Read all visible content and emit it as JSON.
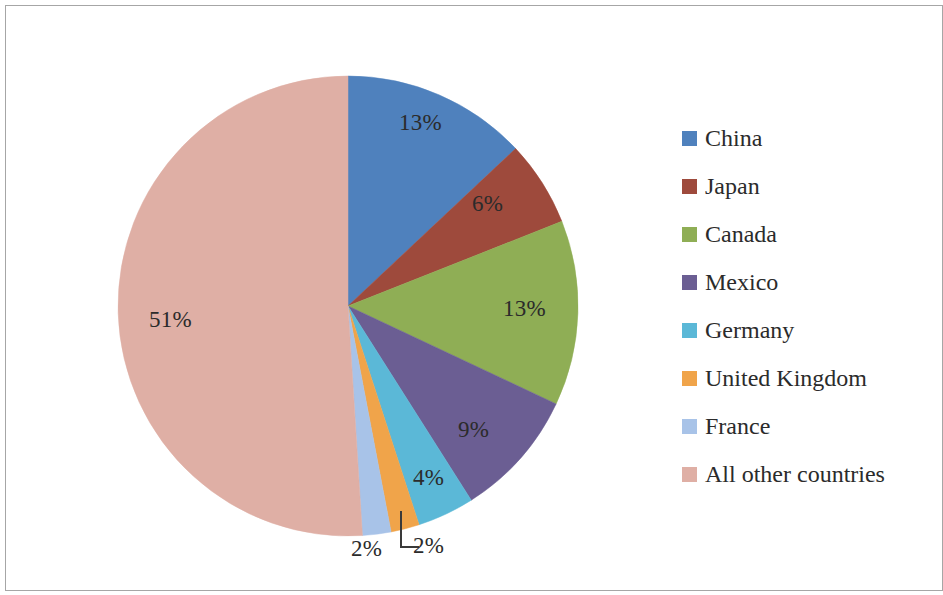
{
  "chart_data": {
    "type": "pie",
    "title": "",
    "subtitle": "",
    "xlabel": "",
    "ylabel": "",
    "legend_position": "right",
    "grid": false,
    "start_angle_clock_position": "12 o'clock",
    "direction": "clockwise",
    "categories": [
      "China",
      "Japan",
      "Canada",
      "Mexico",
      "Germany",
      "United Kingdom",
      "France",
      "All other countries"
    ],
    "values": [
      13,
      6,
      13,
      9,
      4,
      2,
      2,
      51
    ],
    "value_labels": [
      "13%",
      "6%",
      "13%",
      "9%",
      "4%",
      "2%",
      "2%",
      "51%"
    ],
    "colors": [
      "#4F81BD",
      "#9E4A3C",
      "#8FAE55",
      "#6B5E93",
      "#5BB8D7",
      "#F0A44A",
      "#A8C3E8",
      "#DFAFA5"
    ],
    "annotations": [
      "United Kingdom 2% label is placed outside the pie with an L-shaped leader line",
      "France 2% label is placed outside the pie below the slice"
    ]
  },
  "legend": {
    "items": [
      {
        "label": "China",
        "color": "#4F81BD"
      },
      {
        "label": "Japan",
        "color": "#9E4A3C"
      },
      {
        "label": "Canada",
        "color": "#8FAE55"
      },
      {
        "label": "Mexico",
        "color": "#6B5E93"
      },
      {
        "label": "Germany",
        "color": "#5BB8D7"
      },
      {
        "label": "United Kingdom",
        "color": "#F0A44A"
      },
      {
        "label": "France",
        "color": "#A8C3E8"
      },
      {
        "label": "All other countries",
        "color": "#DFAFA5"
      }
    ]
  },
  "slice_labels": [
    {
      "text": "13%",
      "left": 393,
      "top": 104,
      "name": "china"
    },
    {
      "text": "6%",
      "left": 466,
      "top": 185,
      "name": "japan"
    },
    {
      "text": "13%",
      "left": 497,
      "top": 290,
      "name": "canada"
    },
    {
      "text": "9%",
      "left": 452,
      "top": 411,
      "name": "mexico"
    },
    {
      "text": "4%",
      "left": 407,
      "top": 459,
      "name": "germany"
    },
    {
      "text": "2%",
      "left": 407,
      "top": 527,
      "name": "united-kingdom"
    },
    {
      "text": "2%",
      "left": 345,
      "top": 530,
      "name": "france"
    },
    {
      "text": "51%",
      "left": 143,
      "top": 301,
      "name": "all-other-countries"
    }
  ],
  "frame": {
    "border_color": "#a6a6a6",
    "background": "#ffffff"
  }
}
